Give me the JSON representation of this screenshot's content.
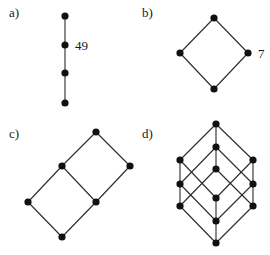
{
  "style": {
    "node_color": "#111111",
    "edge_color": "#2a2a2a",
    "background": "#ffffff",
    "node_radius": 3.6
  },
  "panels": [
    {
      "id": "a",
      "label": "a)",
      "label_pos": [
        9,
        17
      ],
      "nodes": [
        {
          "id": "a1",
          "x": 65,
          "y": 16
        },
        {
          "id": "a2",
          "x": 65,
          "y": 45
        },
        {
          "id": "a3",
          "x": 65,
          "y": 73
        },
        {
          "id": "a4",
          "x": 65,
          "y": 103
        }
      ],
      "edges": [
        [
          "a1",
          "a2"
        ],
        [
          "a2",
          "a3"
        ],
        [
          "a3",
          "a4"
        ]
      ],
      "annotations": [
        {
          "text": "49",
          "x": 75,
          "y": 50
        }
      ]
    },
    {
      "id": "b",
      "label": "b)",
      "label_pos": [
        142,
        17
      ],
      "nodes": [
        {
          "id": "b_top",
          "x": 214,
          "y": 18
        },
        {
          "id": "b_left",
          "x": 180,
          "y": 53
        },
        {
          "id": "b_right",
          "x": 248,
          "y": 53
        },
        {
          "id": "b_bottom",
          "x": 214,
          "y": 89
        }
      ],
      "edges": [
        [
          "b_top",
          "b_left"
        ],
        [
          "b_top",
          "b_right"
        ],
        [
          "b_left",
          "b_bottom"
        ],
        [
          "b_right",
          "b_bottom"
        ]
      ],
      "annotations": [
        {
          "text": "7",
          "x": 258,
          "y": 58
        }
      ]
    },
    {
      "id": "c",
      "label": "c)",
      "label_pos": [
        9,
        138
      ],
      "nodes": [
        {
          "id": "c_top",
          "x": 96,
          "y": 132
        },
        {
          "id": "c_um",
          "x": 62,
          "y": 166
        },
        {
          "id": "c_right",
          "x": 130,
          "y": 166
        },
        {
          "id": "c_left",
          "x": 28,
          "y": 202
        },
        {
          "id": "c_lm",
          "x": 96,
          "y": 202
        },
        {
          "id": "c_bottom",
          "x": 62,
          "y": 237
        }
      ],
      "edges": [
        [
          "c_top",
          "c_um"
        ],
        [
          "c_top",
          "c_right"
        ],
        [
          "c_um",
          "c_lm"
        ],
        [
          "c_right",
          "c_lm"
        ],
        [
          "c_um",
          "c_left"
        ],
        [
          "c_left",
          "c_bottom"
        ],
        [
          "c_lm",
          "c_bottom"
        ]
      ],
      "annotations": []
    },
    {
      "id": "d",
      "label": "d)",
      "label_pos": [
        142,
        138
      ],
      "nodes": [
        {
          "id": "T",
          "x": 216,
          "y": 124
        },
        {
          "id": "A",
          "x": 216,
          "y": 147
        },
        {
          "id": "L1",
          "x": 180,
          "y": 160
        },
        {
          "id": "R1",
          "x": 253,
          "y": 160
        },
        {
          "id": "C",
          "x": 216,
          "y": 169
        },
        {
          "id": "L2",
          "x": 180,
          "y": 184
        },
        {
          "id": "R2",
          "x": 253,
          "y": 184
        },
        {
          "id": "D",
          "x": 216,
          "y": 198
        },
        {
          "id": "L3",
          "x": 180,
          "y": 206
        },
        {
          "id": "R3",
          "x": 253,
          "y": 206
        },
        {
          "id": "E",
          "x": 216,
          "y": 221
        },
        {
          "id": "B",
          "x": 216,
          "y": 243
        }
      ],
      "edges": [
        [
          "T",
          "A"
        ],
        [
          "T",
          "L1"
        ],
        [
          "T",
          "R1"
        ],
        [
          "A",
          "C"
        ],
        [
          "A",
          "L2"
        ],
        [
          "A",
          "R2"
        ],
        [
          "L1",
          "L2"
        ],
        [
          "L1",
          "D"
        ],
        [
          "R1",
          "R2"
        ],
        [
          "R1",
          "D"
        ],
        [
          "C",
          "L3"
        ],
        [
          "C",
          "R3"
        ],
        [
          "L2",
          "L3"
        ],
        [
          "L2",
          "E"
        ],
        [
          "R2",
          "R3"
        ],
        [
          "R2",
          "E"
        ],
        [
          "D",
          "E"
        ],
        [
          "E",
          "B"
        ],
        [
          "L3",
          "B"
        ],
        [
          "R3",
          "B"
        ]
      ],
      "annotations": []
    }
  ]
}
